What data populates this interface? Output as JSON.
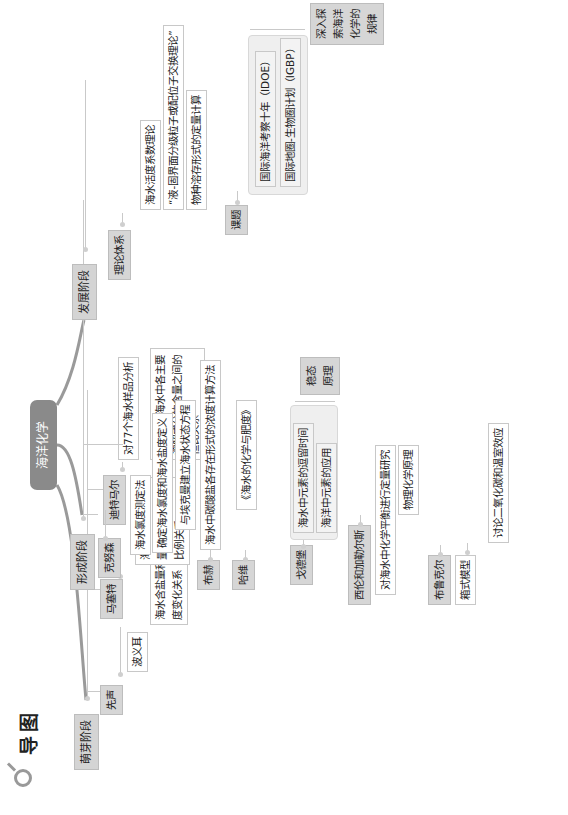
{
  "header": {
    "title": "导图",
    "icon": "magnifier-icon"
  },
  "root": {
    "label": "海洋化学"
  },
  "branches": {
    "sprout": {
      "label": "萌芽阶段",
      "children": {
        "xiansheng": {
          "label": "先声",
          "items": [
            "波义耳",
            "海水含盐量和海水密度变化关系"
          ]
        },
        "masaite": {
          "label": "马塞特",
          "items": [
            "海水主要成分含量有几乎恒定的比例关系"
          ]
        },
        "ditmar": {
          "label": "迪特马尔",
          "items": [
            "对77个海水样品分析",
            "世界大洋海水中各主要溶解成分的含量之间的恒比关系"
          ]
        }
      }
    },
    "formation": {
      "label": "形成阶段",
      "children": {
        "knudsen": {
          "label": "克努森",
          "items": [
            "海水氯度测定法",
            "确定海水氯度和海水盐度定义",
            "与埃克曼建立海水状态方程"
          ]
        },
        "buch": {
          "label": "布赫",
          "items": [
            "海水中碳酸盐各存在形式的浓度计算方法"
          ]
        },
        "harvey": {
          "label": "哈维",
          "items": [
            "《海水的化学与肥度》"
          ]
        },
        "goldberg": {
          "label": "戈德堡",
          "items": [
            "海水中元素的逗留时间",
            "海洋中元素的应用"
          ],
          "note": "稳态原理"
        },
        "sillen": {
          "label": "西伦和加勒尔斯",
          "items": [
            "对海水中化学平衡进行定量研究",
            "物理化学原理"
          ]
        },
        "broecker": {
          "label": "布鲁克尔",
          "items": [
            "箱式模型"
          ],
          "subitems": [
            "讨论二氧化碳和温室效应"
          ]
        }
      }
    },
    "development": {
      "label": "发展阶段",
      "children": {
        "theory": {
          "label": "理论体系",
          "items": [
            "海水活度系数理论",
            "“液-固界面分级粒子或配位子交换理论”",
            "物种溶存形式的定量计算"
          ]
        },
        "topics": {
          "label": "课题",
          "items": [
            "国际海洋考察十年（IDOE）",
            "国际地圈-生物圈计划（IGBP）"
          ],
          "note": "深入探索海洋化学的规律"
        }
      }
    }
  },
  "colors": {
    "root_bg": "#8a8a8a",
    "node_bg": "#d4d4d4",
    "line": "#c9c9c9",
    "curve": "#9a9a9a"
  }
}
